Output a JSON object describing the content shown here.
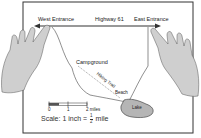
{
  "map": {
    "labels": {
      "west_entrance": "West Entrance",
      "highway": "Highway 61",
      "east_entrance": "East Entrance",
      "campground": "Campground",
      "hiking_trail": "Hiking Trail",
      "beach": "Beach",
      "lake": "Lake"
    },
    "scale_bar": {
      "ticks": [
        "0",
        "1",
        "2 miles"
      ]
    },
    "scale_text": {
      "prefix": "Scale: 1 inch =",
      "numerator": "1",
      "denominator": "2",
      "suffix": "mile"
    },
    "colors": {
      "frame": "#333333",
      "lake": "#b5b5b5",
      "hand": "#c8c8c8",
      "line": "#444444"
    }
  }
}
